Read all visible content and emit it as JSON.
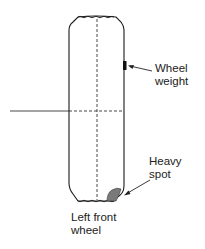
{
  "diagram": {
    "labels": {
      "wheel_weight": [
        "Wheel",
        "weight"
      ],
      "heavy_spot": [
        "Heavy",
        "spot"
      ],
      "caption": [
        "Left front",
        "wheel"
      ]
    },
    "colors": {
      "line": "#1a1a1a",
      "heavy_spot_fill": "#7a7a7a",
      "weight_fill": "#111111"
    }
  }
}
